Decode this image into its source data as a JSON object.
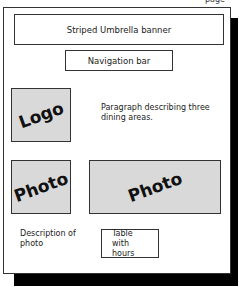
{
  "top_fragment": "page",
  "wireframe": {
    "banner": "Striped Umbrella banner",
    "navigation": "Navigation bar",
    "logo": "Logo",
    "paragraph": "Paragraph describing three dining areas.",
    "photo_left": "Photo",
    "photo_right": "Photo",
    "photo_description": "Description of photo",
    "table": "Table with hours"
  }
}
